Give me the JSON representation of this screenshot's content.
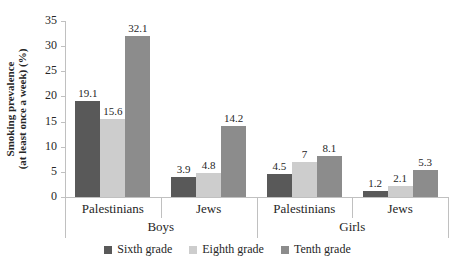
{
  "chart_data": {
    "type": "bar",
    "title": "",
    "ylabel": "Smoking prevalence (at least once a week) (%)",
    "ylabel_lines": [
      "Smoking prevalence",
      "(at least once a week) (%)"
    ],
    "ylim": [
      0,
      35
    ],
    "yticks": [
      0,
      5,
      10,
      15,
      20,
      25,
      30,
      35
    ],
    "grid": false,
    "legend_position": "bottom",
    "axis_color": "#c0c0c0",
    "text_color": "#262626",
    "series": [
      {
        "name": "Sixth grade",
        "color": "#595959"
      },
      {
        "name": "Eighth grade",
        "color": "#cdcdcd"
      },
      {
        "name": "Tenth grade",
        "color": "#8c8c8c"
      }
    ],
    "group_labels": [
      "Boys",
      "Girls"
    ],
    "categories": [
      {
        "label": "Palestinians",
        "group": "Boys",
        "values": [
          19.1,
          15.6,
          32.1
        ],
        "value_labels": [
          "19.1",
          "15.6",
          "32.1"
        ]
      },
      {
        "label": "Jews",
        "group": "Boys",
        "values": [
          3.9,
          4.8,
          14.2
        ],
        "value_labels": [
          "3.9",
          "4.8",
          "14.2"
        ]
      },
      {
        "label": "Palestinians",
        "group": "Girls",
        "values": [
          4.5,
          7,
          8.1
        ],
        "value_labels": [
          "4.5",
          "7",
          "8.1"
        ]
      },
      {
        "label": "Jews",
        "group": "Girls",
        "values": [
          1.2,
          2.1,
          5.3
        ],
        "value_labels": [
          "1.2",
          "2.1",
          "5.3"
        ]
      }
    ]
  }
}
